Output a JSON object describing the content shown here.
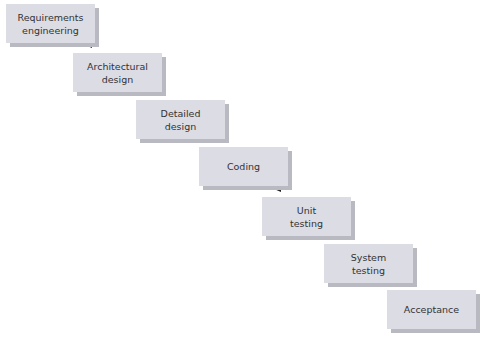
{
  "diagram": {
    "type": "waterfall-model",
    "colors": {
      "box_fill": "#dcdce4",
      "box_shadow": "#b9b9c2",
      "arrow": "#222222",
      "text": "#333333"
    },
    "stages": [
      {
        "label": "Requirements\nengineering",
        "x": 6,
        "y": 4
      },
      {
        "label": "Architectural\ndesign",
        "x": 73,
        "y": 53
      },
      {
        "label": "Detailed\ndesign",
        "x": 136,
        "y": 100
      },
      {
        "label": "Coding",
        "x": 199,
        "y": 147
      },
      {
        "label": "Unit\ntesting",
        "x": 262,
        "y": 197
      },
      {
        "label": "System\ntesting",
        "x": 324,
        "y": 244
      },
      {
        "label": "Acceptance",
        "x": 387,
        "y": 290
      }
    ]
  }
}
